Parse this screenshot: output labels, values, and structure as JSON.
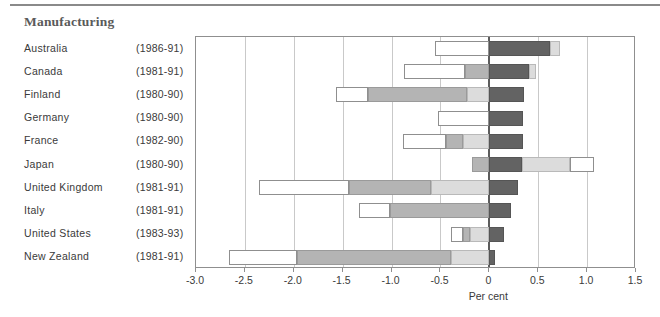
{
  "title": "Manufacturing",
  "axis_title": "Per cent",
  "colors": {
    "white": "#ffffff",
    "light_gray": "#dcdcdc",
    "medium_gray": "#b4b4b4",
    "dark_gray": "#636363",
    "axis": "#8f8f8f",
    "gridline": "#c9c9c9",
    "zeroline": "#5c5c5c"
  },
  "chart_data": {
    "type": "bar",
    "orientation": "horizontal",
    "title": "Manufacturing",
    "xlabel": "Per cent",
    "ylabel": "",
    "xlim": [
      -3.0,
      1.5
    ],
    "xticks": [
      -3.0,
      -2.5,
      -2.0,
      -1.5,
      -1.0,
      -0.5,
      0,
      0.5,
      1.0,
      1.5
    ],
    "xtick_labels": [
      "-3.0",
      "-2.5",
      "-2.0",
      "-1.5",
      "-1.0",
      "-0.5",
      "0",
      "0.5",
      "1.0",
      "1.5"
    ],
    "grid": "vertical",
    "legend": "none",
    "stacked": true,
    "segment_styles": [
      "white",
      "medium_gray",
      "light_gray",
      "dark_gray"
    ],
    "categories": [
      "Australia",
      "Canada",
      "Finland",
      "Germany",
      "France",
      "Japan",
      "United Kingdom",
      "Italy",
      "United States",
      "New Zealand"
    ],
    "periods": [
      "(1986-91)",
      "(1981-91)",
      "(1980-90)",
      "(1980-90)",
      "(1982-90)",
      "(1980-90)",
      "(1981-91)",
      "(1981-91)",
      "(1983-93)",
      "(1981-91)"
    ],
    "rows": [
      {
        "category": "Australia",
        "period": "(1986-91)",
        "segments": [
          {
            "style": "white",
            "from": -0.56,
            "to": 0.0
          },
          {
            "style": "dark",
            "from": 0.0,
            "to": 0.62
          },
          {
            "style": "light",
            "from": 0.62,
            "to": 0.72
          }
        ],
        "net": 0.72
      },
      {
        "category": "Canada",
        "period": "(1981-91)",
        "segments": [
          {
            "style": "white",
            "from": -0.87,
            "to": -0.25
          },
          {
            "style": "medium",
            "from": -0.25,
            "to": 0.0
          },
          {
            "style": "dark",
            "from": 0.0,
            "to": 0.41
          },
          {
            "style": "light",
            "from": 0.41,
            "to": 0.48
          }
        ],
        "net": 0.48
      },
      {
        "category": "Finland",
        "period": "(1980-90)",
        "segments": [
          {
            "style": "white",
            "from": -1.57,
            "to": -1.24
          },
          {
            "style": "medium",
            "from": -1.24,
            "to": -0.23
          },
          {
            "style": "light",
            "from": -0.23,
            "to": 0.0
          },
          {
            "style": "dark",
            "from": 0.0,
            "to": 0.35
          }
        ],
        "net": 0.35
      },
      {
        "category": "Germany",
        "period": "(1980-90)",
        "segments": [
          {
            "style": "white",
            "from": -0.52,
            "to": 0.0
          },
          {
            "style": "dark",
            "from": 0.0,
            "to": 0.34
          }
        ],
        "net": 0.34
      },
      {
        "category": "France",
        "period": "(1982-90)",
        "segments": [
          {
            "style": "white",
            "from": -0.88,
            "to": -0.44
          },
          {
            "style": "medium",
            "from": -0.44,
            "to": -0.27
          },
          {
            "style": "light",
            "from": -0.27,
            "to": 0.0
          },
          {
            "style": "dark",
            "from": 0.0,
            "to": 0.34
          }
        ],
        "net": 0.34
      },
      {
        "category": "Japan",
        "period": "(1980-90)",
        "segments": [
          {
            "style": "medium",
            "from": -0.18,
            "to": 0.0
          },
          {
            "style": "dark",
            "from": 0.0,
            "to": 0.33
          },
          {
            "style": "light",
            "from": 0.33,
            "to": 0.83
          },
          {
            "style": "white",
            "from": 0.83,
            "to": 1.07
          }
        ],
        "net": 1.07
      },
      {
        "category": "United Kingdom",
        "period": "(1981-91)",
        "segments": [
          {
            "style": "white",
            "from": -2.36,
            "to": -1.44
          },
          {
            "style": "medium",
            "from": -1.44,
            "to": -0.6
          },
          {
            "style": "light",
            "from": -0.6,
            "to": 0.0
          },
          {
            "style": "dark",
            "from": 0.0,
            "to": 0.29
          }
        ],
        "net": 0.29
      },
      {
        "category": "Italy",
        "period": "(1981-91)",
        "segments": [
          {
            "style": "white",
            "from": -1.33,
            "to": -1.02
          },
          {
            "style": "medium",
            "from": -1.02,
            "to": 0.0
          },
          {
            "style": "dark",
            "from": 0.0,
            "to": 0.22
          }
        ],
        "net": 0.22
      },
      {
        "category": "United States",
        "period": "(1983-93)",
        "segments": [
          {
            "style": "white",
            "from": -0.39,
            "to": -0.27
          },
          {
            "style": "medium",
            "from": -0.27,
            "to": -0.2
          },
          {
            "style": "light",
            "from": -0.2,
            "to": 0.0
          },
          {
            "style": "dark",
            "from": 0.0,
            "to": 0.15
          }
        ],
        "net": 0.15
      },
      {
        "category": "New Zealand",
        "period": "(1981-91)",
        "segments": [
          {
            "style": "white",
            "from": -2.66,
            "to": -1.97
          },
          {
            "style": "medium",
            "from": -1.97,
            "to": -0.39
          },
          {
            "style": "light",
            "from": -0.39,
            "to": 0.0
          },
          {
            "style": "dark",
            "from": 0.0,
            "to": 0.06
          }
        ],
        "net": 0.06
      }
    ]
  }
}
